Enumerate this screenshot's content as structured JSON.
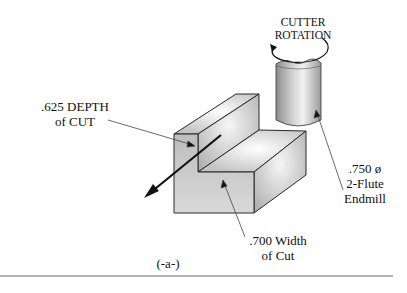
{
  "figure": {
    "caption": "(-a-)",
    "labels": {
      "cutter_rotation": [
        "CUTTER",
        "ROTATION"
      ],
      "depth_of_cut": [
        ".625 DEPTH",
        "of CUT"
      ],
      "endmill": [
        ".750 ø",
        "2-Flute",
        "Endmill"
      ],
      "width_of_cut": [
        ".700 Width",
        "of Cut"
      ]
    },
    "colors": {
      "outline": "#2a2a2a",
      "face_light": "#e4e4e4",
      "face_mid": "#c8c8c8",
      "face_dark": "#a8a8a8",
      "rule": "#666666"
    }
  }
}
